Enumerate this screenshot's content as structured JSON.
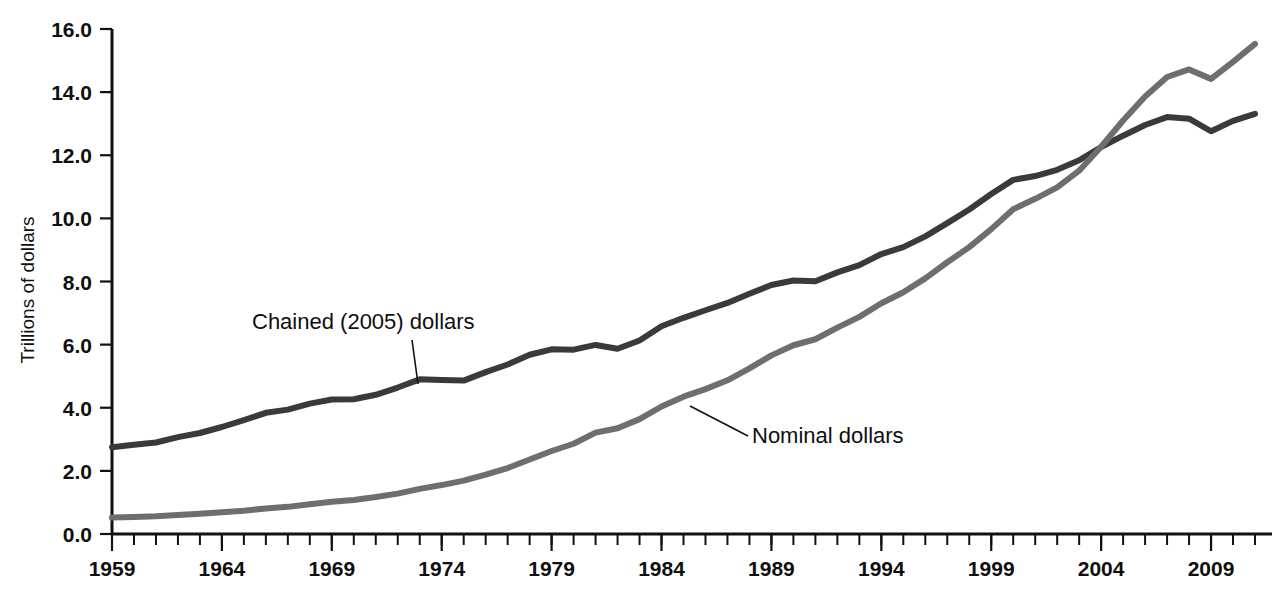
{
  "chart_data": {
    "type": "line",
    "title": "",
    "xlabel": "",
    "ylabel": "Trillions of dollars",
    "xlim": [
      1959,
      2011
    ],
    "ylim": [
      0.0,
      16.0
    ],
    "grid": false,
    "legend_position": "inline-annotations",
    "y_ticks": [
      "0.0",
      "2.0",
      "4.0",
      "6.0",
      "8.0",
      "10.0",
      "12.0",
      "14.0",
      "16.0"
    ],
    "y_tick_values": [
      0.0,
      2.0,
      4.0,
      6.0,
      8.0,
      10.0,
      12.0,
      14.0,
      16.0
    ],
    "x_tick_labels": [
      "1959",
      "1964",
      "1969",
      "1974",
      "1979",
      "1984",
      "1989",
      "1994",
      "1999",
      "2004",
      "2009"
    ],
    "x_tick_values": [
      1959,
      1964,
      1969,
      1974,
      1979,
      1984,
      1989,
      1994,
      1999,
      2004,
      2009
    ],
    "x_minor_tick_interval": 1,
    "x": [
      1959,
      1960,
      1961,
      1962,
      1963,
      1964,
      1965,
      1966,
      1967,
      1968,
      1969,
      1970,
      1971,
      1972,
      1973,
      1974,
      1975,
      1976,
      1977,
      1978,
      1979,
      1980,
      1981,
      1982,
      1983,
      1984,
      1985,
      1986,
      1987,
      1988,
      1989,
      1990,
      1991,
      1992,
      1993,
      1994,
      1995,
      1996,
      1997,
      1998,
      1999,
      2000,
      2001,
      2002,
      2003,
      2004,
      2005,
      2006,
      2007,
      2008,
      2009,
      2010,
      2011
    ],
    "series": [
      {
        "name": "Chained (2005) dollars",
        "color": "#3a3a3a",
        "values": [
          2.75,
          2.83,
          2.9,
          3.07,
          3.2,
          3.39,
          3.61,
          3.84,
          3.94,
          4.13,
          4.26,
          4.27,
          4.41,
          4.64,
          4.9,
          4.88,
          4.86,
          5.13,
          5.37,
          5.68,
          5.85,
          5.84,
          5.99,
          5.87,
          6.13,
          6.58,
          6.85,
          7.09,
          7.32,
          7.61,
          7.89,
          8.03,
          8.01,
          8.29,
          8.52,
          8.87,
          9.09,
          9.43,
          9.85,
          10.28,
          10.77,
          11.22,
          11.34,
          11.54,
          11.84,
          12.26,
          12.62,
          12.96,
          13.21,
          13.16,
          12.76,
          13.09,
          13.31
        ],
        "start_value": 2.75,
        "end_value": 12.9,
        "peak_value": 13.31,
        "annotation": {
          "text": "Chained (2005) dollars",
          "points_to_year": 1975,
          "points_to_value": 4.85
        }
      },
      {
        "name": "Nominal dollars",
        "color": "#6e6e6e",
        "values": [
          0.52,
          0.54,
          0.56,
          0.6,
          0.64,
          0.69,
          0.74,
          0.81,
          0.86,
          0.94,
          1.02,
          1.08,
          1.17,
          1.28,
          1.43,
          1.55,
          1.69,
          1.88,
          2.09,
          2.36,
          2.63,
          2.86,
          3.21,
          3.35,
          3.64,
          4.04,
          4.35,
          4.59,
          4.87,
          5.25,
          5.66,
          5.98,
          6.17,
          6.54,
          6.88,
          7.31,
          7.66,
          8.1,
          8.61,
          9.09,
          9.66,
          10.29,
          10.62,
          10.98,
          11.51,
          12.27,
          13.1,
          13.86,
          14.48,
          14.72,
          14.42,
          14.96,
          15.53
        ],
        "start_value": 0.52,
        "end_value": 14.4,
        "peak_value": 15.53,
        "annotation": {
          "text": "Nominal dollars",
          "points_to_year": 1985,
          "points_to_value": 4.05
        }
      }
    ],
    "crossover_year": 2006,
    "crossover_value": 12.5
  },
  "axis": {
    "y_title": "Trillions of dollars"
  },
  "annotations": {
    "chained": "Chained (2005) dollars",
    "nominal": "Nominal dollars"
  },
  "colors": {
    "chained_line": "#3a3a3a",
    "nominal_line": "#6e6e6e",
    "axis": "#111111",
    "frame_shadow": "#b9b9b9",
    "background": "#ffffff"
  }
}
